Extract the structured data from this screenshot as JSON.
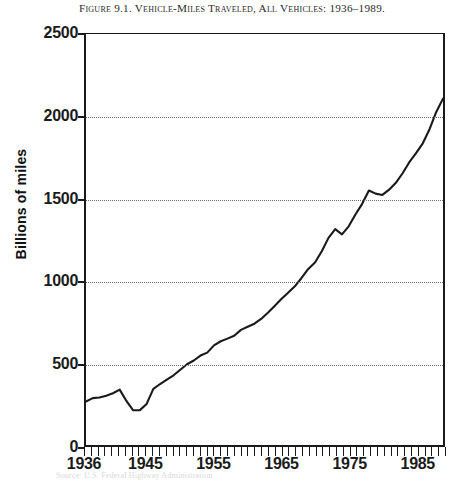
{
  "figure": {
    "caption_prefix": "Figure 9.1.",
    "caption_text": "Vehicle-Miles Traveled, All Vehicles: 1936–1989.",
    "caption_full": "Figure 9.1. Vehicle-Miles Traveled, All Vehicles: 1936–1989.",
    "source_note": "Source: U.S. Federal Highway Administration"
  },
  "chart_data": {
    "type": "line",
    "title": "Figure 9.1. Vehicle-Miles Traveled, All Vehicles: 1936–1989.",
    "xlabel": "",
    "ylabel": "Billions of miles",
    "xlim": [
      1936,
      1989
    ],
    "ylim": [
      0,
      2500
    ],
    "grid": true,
    "legend": "none",
    "y_ticks": [
      0,
      500,
      1000,
      1500,
      2000,
      2500
    ],
    "y_tick_labels": [
      "0",
      "500",
      "1000",
      "1500",
      "2000",
      "2500"
    ],
    "x_ticks": [
      1936,
      1945,
      1955,
      1965,
      1975,
      1985
    ],
    "x_tick_labels": [
      "1936",
      "1945",
      "1955",
      "1965",
      "1975",
      "1985"
    ],
    "x_minor_tick_interval": 1,
    "line_color": "#1a1a1a",
    "series": [
      {
        "name": "Vehicle-miles traveled",
        "units": "billions of miles",
        "x": [
          1936,
          1937,
          1938,
          1939,
          1940,
          1941,
          1942,
          1943,
          1944,
          1945,
          1946,
          1947,
          1948,
          1949,
          1950,
          1951,
          1952,
          1953,
          1954,
          1955,
          1956,
          1957,
          1958,
          1959,
          1960,
          1961,
          1962,
          1963,
          1964,
          1965,
          1966,
          1967,
          1968,
          1969,
          1970,
          1971,
          1972,
          1973,
          1974,
          1975,
          1976,
          1977,
          1978,
          1979,
          1980,
          1981,
          1982,
          1983,
          1984,
          1985,
          1986,
          1987,
          1988,
          1989
        ],
        "values": [
          265,
          285,
          289,
          300,
          315,
          337,
          268,
          211,
          212,
          250,
          341,
          371,
          398,
          424,
          458,
          491,
          514,
          544,
          562,
          606,
          631,
          647,
          665,
          700,
          719,
          738,
          767,
          805,
          846,
          888,
          926,
          965,
          1016,
          1071,
          1110,
          1179,
          1260,
          1313,
          1281,
          1330,
          1402,
          1467,
          1548,
          1529,
          1521,
          1553,
          1595,
          1653,
          1720,
          1775,
          1835,
          1921,
          2026,
          2107
        ]
      }
    ],
    "annotations": [
      {
        "label": "WWII gasoline rationing trough",
        "x": 1943,
        "y": 211
      },
      {
        "label": "1973–74 oil embargo dip",
        "x": 1974,
        "y": 1281
      },
      {
        "label": "1979–81 energy crisis plateau",
        "x": 1980,
        "y": 1521
      }
    ]
  },
  "axes": {
    "y_title": "Billions of miles"
  }
}
